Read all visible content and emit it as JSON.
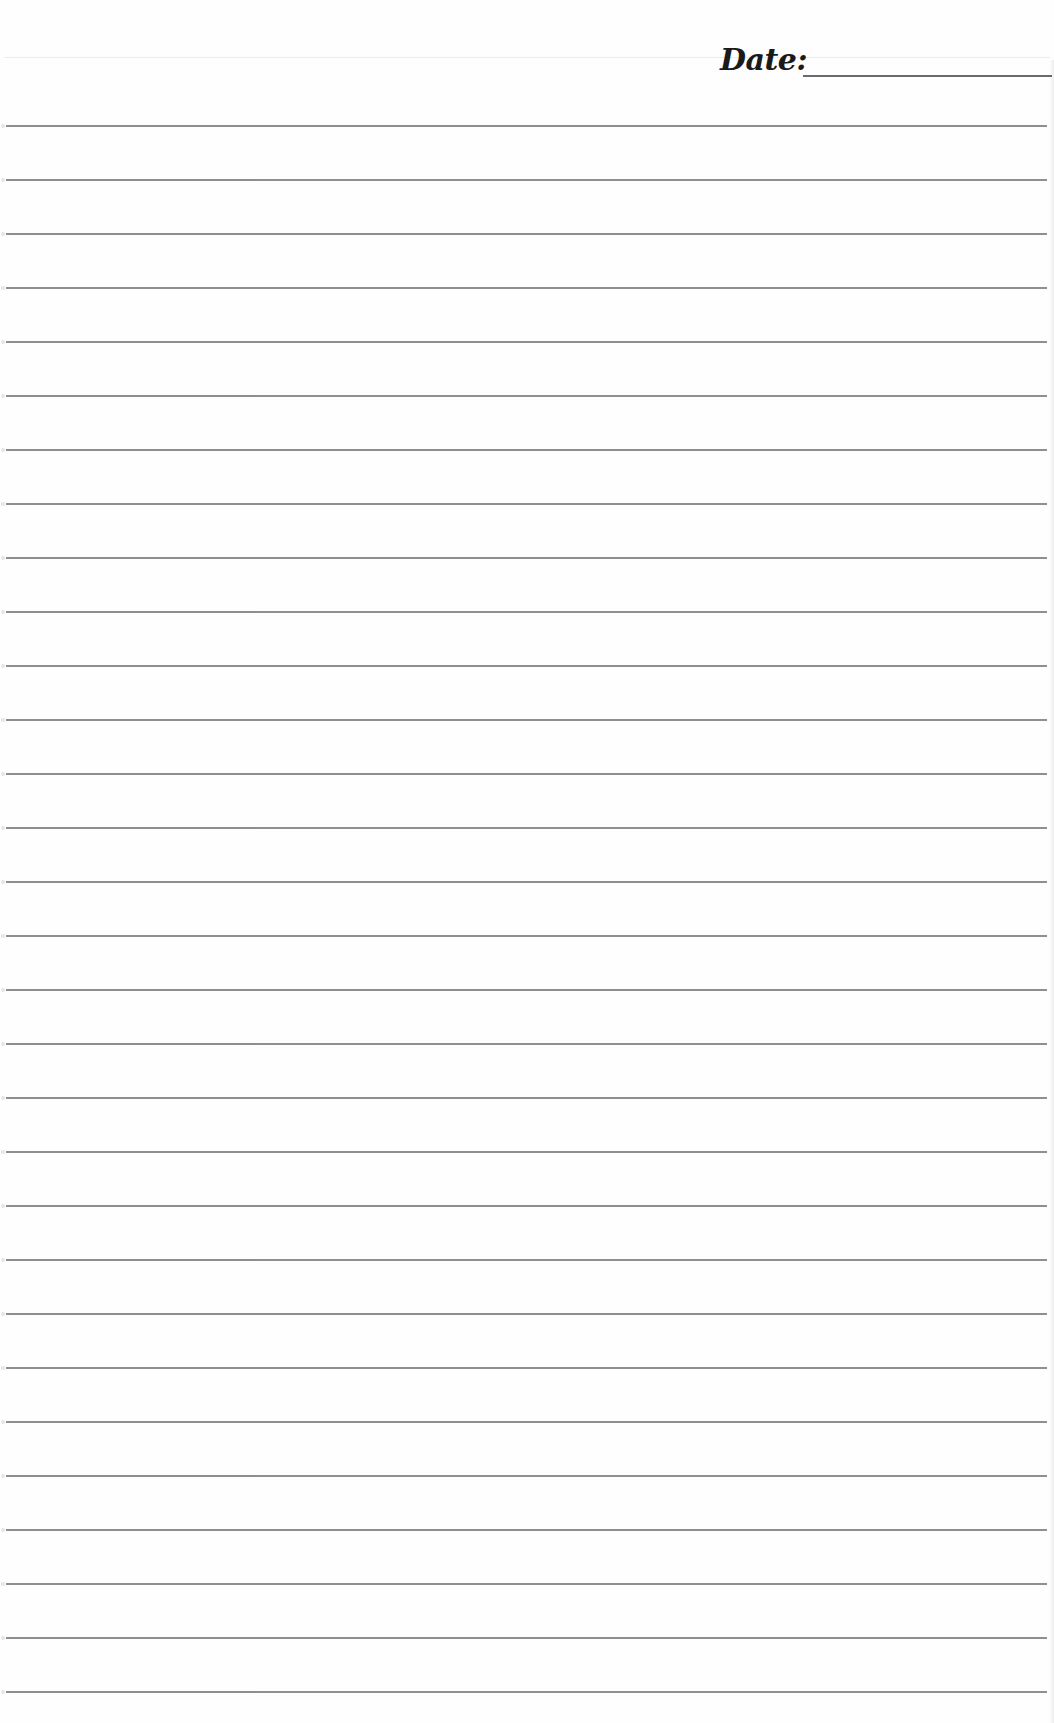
{
  "page": {
    "type": "lined-notebook-paper",
    "background_color": "#fefefe",
    "line_color": "#7b7b7b"
  },
  "header": {
    "date_label": "Date:",
    "date_value": "",
    "date_placeholder": ""
  },
  "ruled_lines": {
    "count": 30,
    "first_line_y": 125,
    "spacing": 54,
    "left_x": 6,
    "right_x": 1047
  }
}
